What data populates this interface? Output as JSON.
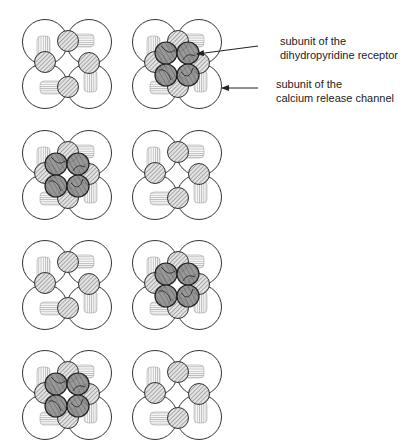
{
  "figure": {
    "grid": {
      "columns": 2,
      "rows": 4,
      "col_centers_x": [
        67,
        177
      ],
      "row_centers_y": [
        64,
        175,
        285,
        395
      ]
    },
    "panels": [
      {
        "row": 0,
        "col": 0,
        "has_receptor_tetrad": false
      },
      {
        "row": 0,
        "col": 1,
        "has_receptor_tetrad": true
      },
      {
        "row": 1,
        "col": 0,
        "has_receptor_tetrad": true
      },
      {
        "row": 1,
        "col": 1,
        "has_receptor_tetrad": false
      },
      {
        "row": 2,
        "col": 0,
        "has_receptor_tetrad": false
      },
      {
        "row": 2,
        "col": 1,
        "has_receptor_tetrad": true
      },
      {
        "row": 3,
        "col": 0,
        "has_receptor_tetrad": true
      },
      {
        "row": 3,
        "col": 1,
        "has_receptor_tetrad": false
      }
    ],
    "colors": {
      "outline": "#333333",
      "hatch": "#666666",
      "receptor_fill": "#8a8a8a",
      "background": "#ffffff"
    }
  },
  "labels": [
    {
      "id": "dhpr",
      "line1": "subunit of the",
      "line2": "dihydropyridine receptor",
      "x": 280,
      "y": 34,
      "arrow": {
        "from": [
          258,
          46
        ],
        "to": [
          197,
          54
        ]
      }
    },
    {
      "id": "ryr",
      "line1": "subunit of the",
      "line2": "calcium release channel",
      "x": 276,
      "y": 77,
      "arrow": {
        "from": [
          258,
          88
        ],
        "to": [
          222,
          88
        ]
      }
    }
  ]
}
